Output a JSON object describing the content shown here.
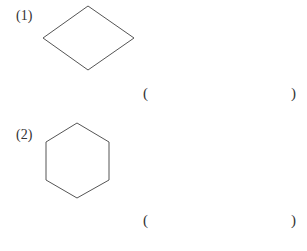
{
  "problems": [
    {
      "number": "(1)",
      "shape": "rhombus",
      "answer_open": "(",
      "answer_value": "",
      "answer_close": ")"
    },
    {
      "number": "(2)",
      "shape": "hexagon",
      "answer_open": "(",
      "answer_value": "",
      "answer_close": ")"
    }
  ],
  "colors": {
    "stroke": "#555555",
    "text": "#333333",
    "background": "#ffffff"
  }
}
